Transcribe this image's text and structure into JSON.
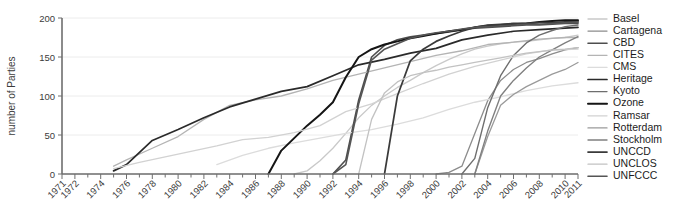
{
  "chart_data": {
    "type": "line",
    "title": "",
    "subtitle": "",
    "xlabel": "",
    "ylabel": "number of Parties",
    "xlim": [
      1971,
      2011
    ],
    "ylim": [
      0,
      200
    ],
    "grid": true,
    "legend_position": "right",
    "y_ticks": [
      0,
      50,
      100,
      150,
      200
    ],
    "x_ticks": [
      1971,
      1972,
      1974,
      1976,
      1978,
      1980,
      1982,
      1984,
      1986,
      1988,
      1990,
      1992,
      1994,
      1996,
      1998,
      2000,
      2002,
      2004,
      2006,
      2008,
      2010,
      2011
    ],
    "x_tick_labels": [
      "1971",
      "1972",
      "1974",
      "1976",
      "1978",
      "1980",
      "1982",
      "1984",
      "1986",
      "1988",
      "1990",
      "1992",
      "1994",
      "1996",
      "1998",
      "2000",
      "2002",
      "2004",
      "2006",
      "2008",
      "2010",
      "2011"
    ],
    "x_minor_ticks": [
      1973,
      1975,
      1977,
      1979,
      1981,
      1983,
      1985,
      1987,
      1989,
      1991,
      1993,
      1995,
      1997,
      1999,
      2001,
      2003,
      2005,
      2007,
      2009
    ],
    "series": [
      {
        "name": "Basel",
        "color": "#c9c9c9",
        "width": 1.3,
        "x": [
          1989,
          1990,
          1991,
          1992,
          1993,
          1994,
          1995,
          1996,
          1997,
          1998,
          1999,
          2000,
          2001,
          2002,
          2003,
          2004,
          2005,
          2006,
          2007,
          2008,
          2009,
          2010,
          2011
        ],
        "values": [
          0,
          4,
          17,
          33,
          52,
          72,
          88,
          100,
          111,
          120,
          130,
          139,
          147,
          154,
          160,
          164,
          167,
          169,
          170,
          172,
          174,
          175,
          178
        ]
      },
      {
        "name": "Cartagena",
        "color": "#8c8c8c",
        "width": 1.3,
        "x": [
          2000,
          2001,
          2002,
          2003,
          2004,
          2005,
          2006,
          2007,
          2008,
          2009,
          2010,
          2011
        ],
        "values": [
          0,
          2,
          10,
          52,
          94,
          120,
          134,
          143,
          148,
          154,
          159,
          162
        ]
      },
      {
        "name": "CBD",
        "color": "#4e4e4e",
        "width": 1.6,
        "x": [
          1992,
          1993,
          1994,
          1995,
          1996,
          1997,
          1998,
          1999,
          2000,
          2001,
          2002,
          2003,
          2004,
          2005,
          2006,
          2007,
          2008,
          2009,
          2010,
          2011
        ],
        "values": [
          0,
          18,
          95,
          150,
          165,
          172,
          176,
          178,
          180,
          182,
          185,
          187,
          188,
          189,
          190,
          191,
          191,
          192,
          193,
          193
        ]
      },
      {
        "name": "CITES",
        "color": "#b4b4b4",
        "width": 1.3,
        "x": [
          1975,
          1976,
          1978,
          1980,
          1982,
          1984,
          1986,
          1988,
          1990,
          1992,
          1994,
          1996,
          1998,
          2000,
          2002,
          2004,
          2006,
          2008,
          2010,
          2011
        ],
        "values": [
          10,
          18,
          33,
          48,
          70,
          88,
          95,
          100,
          109,
          120,
          128,
          136,
          144,
          152,
          158,
          166,
          169,
          173,
          175,
          175
        ]
      },
      {
        "name": "CMS",
        "color": "#dcdcdc",
        "width": 1.3,
        "x": [
          1983,
          1985,
          1987,
          1989,
          1991,
          1993,
          1995,
          1997,
          1999,
          2001,
          2003,
          2005,
          2007,
          2009,
          2011
        ],
        "values": [
          12,
          24,
          33,
          40,
          46,
          52,
          57,
          64,
          72,
          83,
          92,
          99,
          107,
          113,
          117
        ]
      },
      {
        "name": "Heritage",
        "color": "#2a2a2a",
        "width": 1.7,
        "x": [
          1975,
          1976,
          1978,
          1980,
          1982,
          1984,
          1986,
          1988,
          1990,
          1992,
          1994,
          1996,
          1998,
          2000,
          2002,
          2004,
          2006,
          2008,
          2010,
          2011
        ],
        "values": [
          4,
          12,
          43,
          57,
          72,
          86,
          96,
          106,
          112,
          126,
          140,
          147,
          155,
          161,
          172,
          178,
          183,
          185,
          187,
          188
        ]
      },
      {
        "name": "Kyoto",
        "color": "#6e6e6e",
        "width": 1.4,
        "x": [
          2002,
          2003,
          2004,
          2005,
          2006,
          2007,
          2008,
          2009,
          2010,
          2011
        ],
        "values": [
          0,
          20,
          85,
          126,
          152,
          168,
          178,
          184,
          189,
          191
        ]
      },
      {
        "name": "Ozone",
        "color": "#151515",
        "width": 2.0,
        "x": [
          1987,
          1988,
          1989,
          1990,
          1991,
          1992,
          1993,
          1994,
          1995,
          1996,
          1997,
          1998,
          1999,
          2000,
          2001,
          2002,
          2003,
          2004,
          2005,
          2006,
          2007,
          2008,
          2009,
          2010,
          2011
        ],
        "values": [
          0,
          30,
          46,
          62,
          76,
          92,
          124,
          150,
          160,
          166,
          170,
          174,
          177,
          180,
          183,
          185,
          188,
          190,
          191,
          192,
          193,
          195,
          196,
          197,
          197
        ]
      },
      {
        "name": "Ramsar",
        "color": "#d2d2d2",
        "width": 1.3,
        "x": [
          1975,
          1977,
          1979,
          1981,
          1983,
          1985,
          1987,
          1989,
          1991,
          1993,
          1995,
          1997,
          1999,
          2001,
          2003,
          2005,
          2007,
          2009,
          2011
        ],
        "values": [
          7,
          15,
          22,
          29,
          36,
          44,
          47,
          53,
          62,
          80,
          90,
          103,
          116,
          128,
          138,
          146,
          154,
          159,
          160
        ]
      },
      {
        "name": "Rotterdam",
        "color": "#9a9a9a",
        "width": 1.3,
        "x": [
          2003,
          2004,
          2005,
          2006,
          2007,
          2008,
          2009,
          2010,
          2011
        ],
        "values": [
          0,
          48,
          88,
          102,
          112,
          120,
          128,
          134,
          143
        ]
      },
      {
        "name": "Stockholm",
        "color": "#808080",
        "width": 1.4,
        "x": [
          2003,
          2004,
          2005,
          2006,
          2007,
          2008,
          2009,
          2010,
          2011
        ],
        "values": [
          0,
          55,
          100,
          120,
          136,
          150,
          159,
          168,
          176
        ]
      },
      {
        "name": "UNCCD",
        "color": "#3a3a3a",
        "width": 1.7,
        "x": [
          1996,
          1997,
          1998,
          1999,
          2000,
          2001,
          2002,
          2003,
          2004,
          2005,
          2006,
          2007,
          2008,
          2009,
          2010,
          2011
        ],
        "values": [
          0,
          100,
          145,
          160,
          170,
          177,
          183,
          188,
          191,
          192,
          193,
          193,
          194,
          194,
          195,
          195
        ]
      },
      {
        "name": "UNCLOS",
        "color": "#c2c2c2",
        "width": 1.3,
        "x": [
          1994,
          1995,
          1996,
          1997,
          1998,
          1999,
          2000,
          2001,
          2002,
          2003,
          2004,
          2005,
          2006,
          2007,
          2008,
          2009,
          2010,
          2011
        ],
        "values": [
          0,
          70,
          104,
          118,
          126,
          130,
          133,
          137,
          140,
          143,
          146,
          149,
          152,
          155,
          157,
          159,
          160,
          162
        ]
      },
      {
        "name": "UNFCCC",
        "color": "#555555",
        "width": 1.6,
        "x": [
          1992,
          1993,
          1994,
          1995,
          1996,
          1997,
          1998,
          1999,
          2000,
          2001,
          2002,
          2003,
          2004,
          2005,
          2006,
          2007,
          2008,
          2009,
          2010,
          2011
        ],
        "values": [
          0,
          12,
          90,
          146,
          160,
          167,
          174,
          178,
          181,
          183,
          186,
          188,
          189,
          190,
          191,
          192,
          192,
          193,
          194,
          195
        ]
      }
    ]
  },
  "legend": {
    "items": [
      {
        "label": "Basel"
      },
      {
        "label": "Cartagena"
      },
      {
        "label": "CBD"
      },
      {
        "label": "CITES"
      },
      {
        "label": "CMS"
      },
      {
        "label": "Heritage"
      },
      {
        "label": "Kyoto"
      },
      {
        "label": "Ozone"
      },
      {
        "label": "Ramsar"
      },
      {
        "label": "Rotterdam"
      },
      {
        "label": "Stockholm"
      },
      {
        "label": "UNCCD"
      },
      {
        "label": "UNCLOS"
      },
      {
        "label": "UNFCCC"
      }
    ]
  }
}
